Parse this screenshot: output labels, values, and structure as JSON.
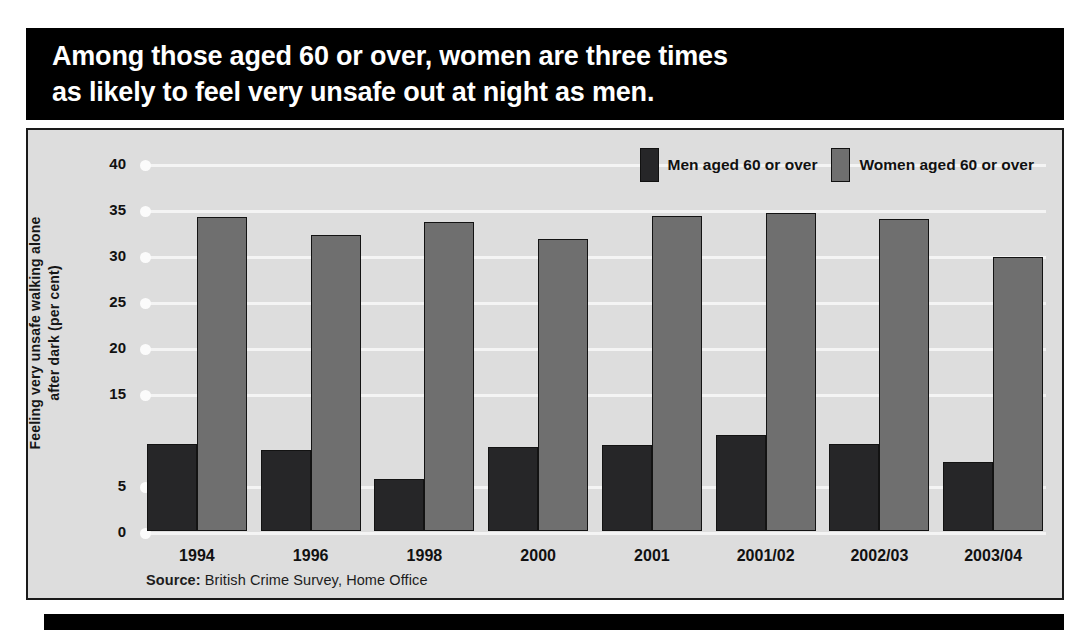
{
  "title": {
    "text": "Among those aged 60 or over, women are three times\nas likely to feel very unsafe out at night as men."
  },
  "source": {
    "label": "Source:",
    "text": " British Crime Survey, Home Office"
  },
  "colors": {
    "men": "#262628",
    "women": "#6f6f6f",
    "panel_background": "#dddddd",
    "banner": "#000000",
    "gridline": "#f4f4f4"
  },
  "chart_data": {
    "type": "bar",
    "title": "Among those aged 60 or over, women are three times as likely to feel very unsafe out at night as men.",
    "xlabel": "",
    "ylabel": "Feeling very unsafe walking alone\nafter dark (per cent)",
    "ylim": [
      0,
      40
    ],
    "yticks": [
      0,
      5,
      10,
      15,
      20,
      25,
      30,
      35,
      40
    ],
    "ytick_labels": [
      "0",
      "5",
      "",
      "15",
      "20",
      "25",
      "30",
      "35",
      "40"
    ],
    "grid": true,
    "legend_position": "top-right",
    "categories": [
      "1994",
      "1996",
      "1998",
      "2000",
      "2001",
      "2001/02",
      "2002/03",
      "2003/04"
    ],
    "series": [
      {
        "name": "Men aged 60 or over",
        "color": "#262628",
        "values": [
          9.5,
          8.8,
          5.7,
          9.1,
          9.3,
          10.4,
          9.5,
          7.5
        ]
      },
      {
        "name": "Women aged 60 or over",
        "color": "#6f6f6f",
        "values": [
          34.1,
          32.2,
          33.6,
          31.7,
          34.2,
          34.6,
          33.9,
          29.8
        ]
      }
    ]
  }
}
